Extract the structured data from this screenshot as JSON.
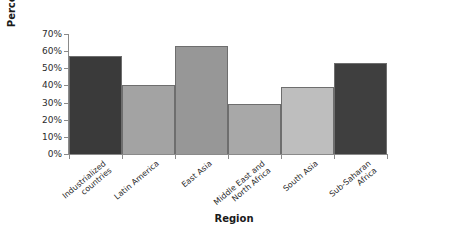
{
  "chart_data": {
    "type": "bar",
    "title": "",
    "xlabel": "Region",
    "ylabel": "Percentage",
    "categories": [
      "Industrialized\ncountries",
      "Latin America",
      "East Asia",
      "Middle East and\nNorth Africa",
      "South Asia",
      "Sub-Saharan\nAfrica"
    ],
    "values": [
      57,
      40,
      63,
      29,
      39,
      53
    ],
    "ylim": [
      0,
      70
    ],
    "ytick_labels": [
      "0%",
      "10%",
      "20%",
      "30%",
      "40%",
      "50%",
      "60%",
      "70%"
    ],
    "ytick_values": [
      0,
      10,
      20,
      30,
      40,
      50,
      60,
      70
    ],
    "grid": false,
    "legend": "none",
    "bar_colors": [
      "#3a3a3a",
      "#a3a3a3",
      "#979797",
      "#a8a8a8",
      "#bebebe",
      "#3f3f3f"
    ],
    "bar_border_color": "#6e6e6e",
    "axis_color": "#8a8a8a"
  }
}
